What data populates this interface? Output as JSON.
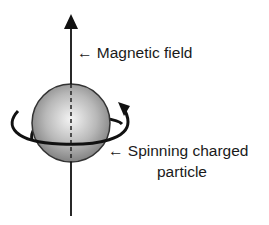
{
  "diagram": {
    "labels": {
      "magnetic_field": "← Magnetic field",
      "particle_line1": "← Spinning charged",
      "particle_line2": "particle"
    },
    "colors": {
      "stroke": "#111111",
      "sphere_light": "#f2f2f2",
      "sphere_dark": "#7a7a7a"
    }
  }
}
